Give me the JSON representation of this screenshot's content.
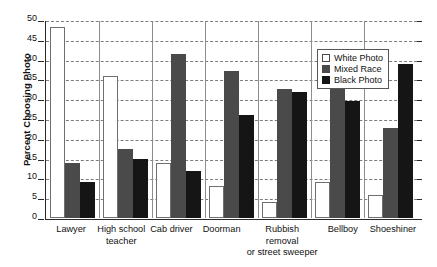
{
  "chart_data": {
    "type": "bar",
    "title": "",
    "xlabel": "",
    "ylabel": "Percent Choosing Photo",
    "ylim": [
      0,
      50
    ],
    "ytick_step": 5,
    "yticks": [
      0,
      5,
      10,
      15,
      20,
      25,
      30,
      35,
      40,
      45,
      50
    ],
    "grid": "horizontal-dashed",
    "legend_position": "top-right",
    "categories": [
      "Lawyer",
      "High school teacher",
      "Cab driver",
      "Doorman",
      "Rubbish removal or street sweeper",
      "Bellboy",
      "Shoeshiner"
    ],
    "category_lines": [
      [
        "Lawyer"
      ],
      [
        "High school",
        "teacher"
      ],
      [
        "Cab driver"
      ],
      [
        "Doorman"
      ],
      [
        "Rubbish",
        "removal",
        "or street sweeper"
      ],
      [
        "Bellboy"
      ],
      [
        "Shoeshiner"
      ]
    ],
    "series": [
      {
        "name": "White Photo",
        "color": "#ffffff",
        "values": [
          48.2,
          35.8,
          13.8,
          8.2,
          4.0,
          9.0,
          5.8
        ]
      },
      {
        "name": "Mixed Race",
        "color": "#4a4a4a",
        "values": [
          13.8,
          17.4,
          41.5,
          37.0,
          32.5,
          32.8,
          22.8
        ]
      },
      {
        "name": "Black Photo",
        "color": "#151515",
        "values": [
          9.2,
          14.8,
          11.9,
          26.0,
          31.7,
          29.5,
          38.8
        ]
      }
    ]
  },
  "legend": {
    "items": [
      {
        "label": "White Photo",
        "swatch": "white"
      },
      {
        "label": "Mixed Race",
        "swatch": "mixed"
      },
      {
        "label": "Black Photo",
        "swatch": "black"
      }
    ]
  },
  "axis": {
    "y_title": "Percent Choosing Photo"
  }
}
